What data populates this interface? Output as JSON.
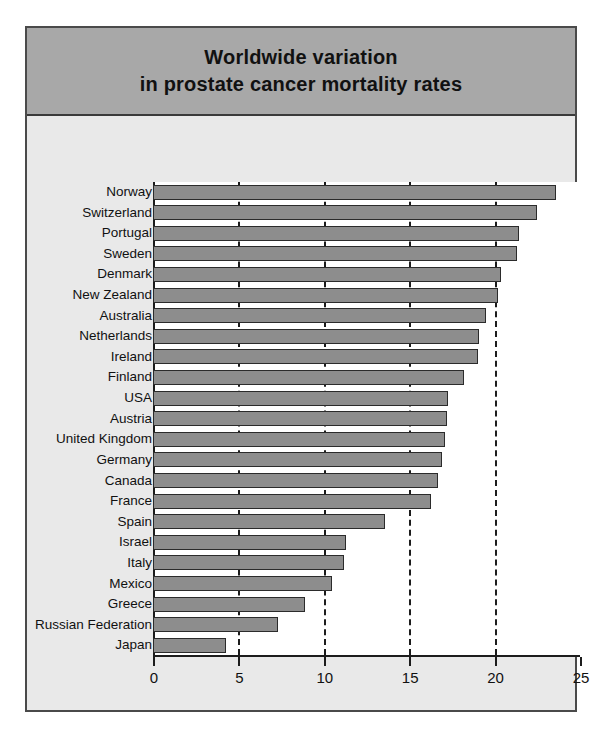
{
  "chart_data": {
    "type": "bar",
    "orientation": "horizontal",
    "title": "Worldwide variation in prostate cancer mortality rates",
    "title_lines": [
      "Worldwide variation",
      "in prostate cancer mortality rates"
    ],
    "xlabel": "",
    "ylabel": "",
    "xlim": [
      0,
      25
    ],
    "xticks": [
      0,
      5,
      10,
      15,
      20,
      25
    ],
    "xtick_labels": [
      "0",
      "5",
      "10",
      "15",
      "20",
      "25"
    ],
    "grid": "vertical dashed gridlines at 5, 10, 15, 20",
    "legend": "none",
    "bar_color": "#8d8d8d",
    "bar_edge_color": "#2b2b2b",
    "categories": [
      "Norway",
      "Switzerland",
      "Portugal",
      "Sweden",
      "Denmark",
      "New Zealand",
      "Australia",
      "Netherlands",
      "Ireland",
      "Finland",
      "USA",
      "Austria",
      "United Kingdom",
      "Germany",
      "Canada",
      "France",
      "Spain",
      "Israel",
      "Italy",
      "Mexico",
      "Greece",
      "Russian Federation",
      "Japan"
    ],
    "values": [
      23.6,
      22.5,
      21.4,
      21.3,
      20.4,
      20.2,
      19.5,
      19.1,
      19.0,
      18.2,
      17.3,
      17.2,
      17.1,
      16.9,
      16.7,
      16.3,
      13.6,
      11.3,
      11.2,
      10.5,
      8.9,
      7.3,
      4.3
    ]
  },
  "figure": {
    "background": "#e9e9e9",
    "title_band_color": "#a8a8a8",
    "border_color": "#4a4a4a"
  }
}
